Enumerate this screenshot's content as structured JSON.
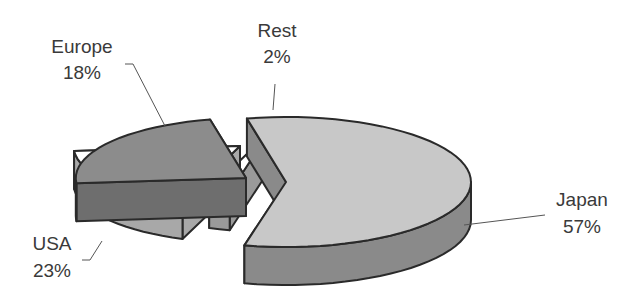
{
  "chart_data": {
    "type": "pie",
    "style": "3d-exploded",
    "title": "",
    "legend": "none",
    "slices": [
      {
        "label": "Japan",
        "value": 57,
        "display": "57%",
        "top_color": "#c8c8c8",
        "side_color": "#8a8a8a"
      },
      {
        "label": "USA",
        "value": 23,
        "display": "23%",
        "top_color": "#8c8c8c",
        "side_color": "#6e6e6e"
      },
      {
        "label": "Europe",
        "value": 18,
        "display": "18%",
        "top_color": "#ffffff",
        "side_color": "#a8a8a8"
      },
      {
        "label": "Rest",
        "value": 2,
        "display": "2%",
        "top_color": "#ffffff",
        "side_color": "#9a9a9a"
      }
    ]
  }
}
